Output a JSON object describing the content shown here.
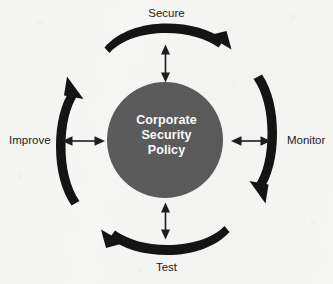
{
  "diagram": {
    "title_text": "Corporate Security Policy",
    "hub": {
      "name": "corporate-security-policy",
      "lines": [
        "Corporate",
        "Security",
        "Policy"
      ],
      "fill_color": "#5b5b5b",
      "text_color": "#ffffff",
      "center_x": 165,
      "center_y": 140,
      "radius": 58
    },
    "cycle_direction": "clockwise",
    "stages": [
      {
        "id": "secure",
        "label": "Secure",
        "position": "top",
        "arc_arrow_points": "right",
        "connector": "double-headed-vertical"
      },
      {
        "id": "monitor",
        "label": "Monitor",
        "position": "right",
        "arc_arrow_points": "down",
        "connector": "double-headed-horizontal"
      },
      {
        "id": "test",
        "label": "Test",
        "position": "bottom",
        "arc_arrow_points": "left",
        "connector": "double-headed-vertical"
      },
      {
        "id": "improve",
        "label": "Improve",
        "position": "left",
        "arc_arrow_points": "up",
        "connector": "double-headed-horizontal"
      }
    ],
    "colors": {
      "background": "#f6f6f4",
      "arc_stroke": "#141414",
      "connector_stroke": "#1d1d1d",
      "label_text": "#1d1d1d"
    }
  }
}
